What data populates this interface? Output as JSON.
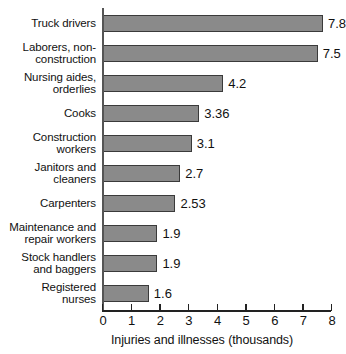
{
  "chart_data": {
    "type": "bar",
    "orientation": "horizontal",
    "title": "",
    "xlabel": "Injuries and illnesses (thousands)",
    "ylabel": "",
    "xlim": [
      0,
      8
    ],
    "xticks": [
      "0",
      "1",
      "2",
      "3",
      "4",
      "5",
      "6",
      "7",
      "8"
    ],
    "grid": false,
    "legend": null,
    "categories": [
      "Truck drivers",
      "Laborers, non-\nconstruction",
      "Nursing aides,\norderlies",
      "Cooks",
      "Construction\nworkers",
      "Janitors and\ncleaners",
      "Carpenters",
      "Maintenance and\nrepair workers",
      "Stock handlers\nand baggers",
      "Registered\nnurses"
    ],
    "values": [
      7.8,
      7.5,
      4.2,
      3.36,
      3.1,
      2.7,
      2.53,
      1.9,
      1.9,
      1.6
    ],
    "value_labels": [
      "7.8",
      "7.5",
      "4.2",
      "3.36",
      "3.1",
      "2.7",
      "2.53",
      "1.9",
      "1.9",
      "1.6"
    ],
    "colors": {
      "bar_fill": "#8a8a8a",
      "bar_stroke": "#3a3a3a",
      "axis": "#222222",
      "text": "#111111",
      "background": "#ffffff"
    }
  }
}
